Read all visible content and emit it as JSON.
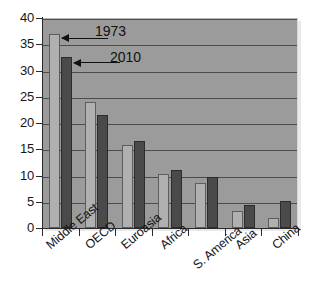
{
  "chart_data": {
    "type": "bar",
    "title": "",
    "subtitle": "",
    "xlabel": "",
    "ylabel": "",
    "categories": [
      "Middle East",
      "OECD",
      "Euroasia",
      "Africa",
      "S. America",
      "Asia",
      "China"
    ],
    "series": [
      {
        "name": "1973",
        "color": "#b0b0b0",
        "values": [
          37.0,
          24.0,
          15.8,
          10.2,
          8.6,
          3.3,
          2.0
        ]
      },
      {
        "name": "2010",
        "color": "#4a4a4a",
        "values": [
          32.5,
          21.5,
          16.5,
          11.0,
          9.7,
          4.3,
          5.2
        ]
      }
    ],
    "ylim": [
      0,
      40
    ],
    "yticks": [
      0,
      5,
      10,
      15,
      20,
      25,
      30,
      35,
      40
    ],
    "ytick_labels": [
      "0",
      "5",
      "10",
      "15",
      "20",
      "25",
      "30",
      "35",
      "40"
    ],
    "grid": true,
    "grid_axis": "y",
    "legend": false,
    "annotations": [
      {
        "text": "1973",
        "points_to_series": "1973",
        "points_to_category": "Middle East"
      },
      {
        "text": "2010",
        "points_to_series": "2010",
        "points_to_category": "Middle East"
      }
    ],
    "plot_background": "#9b9b9b",
    "figure_background": "#ffffff",
    "axis_color": "#2a2a2a",
    "gridline_color": "#4c4c4c"
  }
}
